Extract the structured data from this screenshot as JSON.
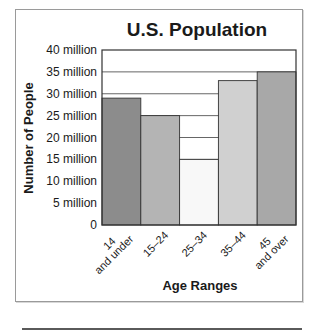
{
  "chart_data": {
    "type": "bar",
    "title": "U.S. Population",
    "xlabel": "Age Ranges",
    "ylabel": "Number of People",
    "categories": [
      [
        "14",
        "and under"
      ],
      [
        "15–24"
      ],
      [
        "25–34"
      ],
      [
        "35–44"
      ],
      [
        "45",
        "and over"
      ]
    ],
    "values": [
      29000000,
      25000000,
      15000000,
      33000000,
      35000000
    ],
    "bar_colors": [
      "#8c8c8c",
      "#b4b4b4",
      "#f8f8f8",
      "#d0d0d0",
      "#a8a8a8"
    ],
    "ylim": [
      0,
      40000000
    ],
    "yticks": [
      {
        "value": 0,
        "label": "0"
      },
      {
        "value": 5000000,
        "label": "5 million"
      },
      {
        "value": 10000000,
        "label": "10 million"
      },
      {
        "value": 15000000,
        "label": "15 million"
      },
      {
        "value": 20000000,
        "label": "20 million"
      },
      {
        "value": 25000000,
        "label": "25 million"
      },
      {
        "value": 30000000,
        "label": "30 million"
      },
      {
        "value": 35000000,
        "label": "35 million"
      },
      {
        "value": 40000000,
        "label": "40 million"
      }
    ],
    "grid": true,
    "legend": "none"
  }
}
